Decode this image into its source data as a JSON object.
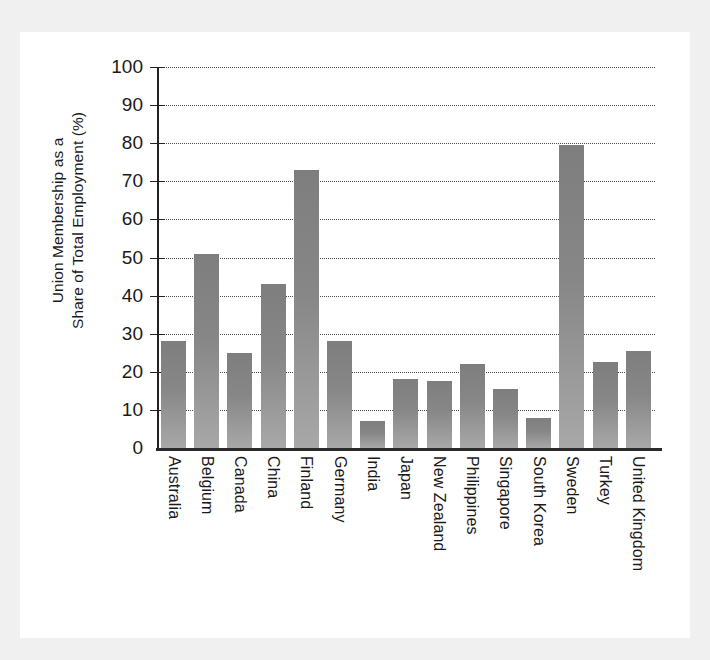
{
  "chart_data": {
    "type": "bar",
    "title": "",
    "xlabel": "",
    "ylabel": "Union Membership as a Share of Total Employment (%)",
    "ylabel_line1": "Union Membership as a",
    "ylabel_line2": "Share of Total Employment (%)",
    "ylim": [
      0,
      100
    ],
    "ytick_step": 10,
    "yticks": [
      100,
      90,
      80,
      70,
      60,
      50,
      40,
      30,
      20,
      10,
      0
    ],
    "grid": true,
    "grid_style": "dotted-horizontal",
    "legend": "none",
    "bar_color": "#8a8a8a",
    "bar_color_top": "#7e7e7e",
    "bar_color_bottom": "#a8a8a8",
    "axis_color": "#222222",
    "background": "#ffffff",
    "figure_background": "#f0f0f0",
    "categories": [
      "Australia",
      "Belgium",
      "Canada",
      "China",
      "Finland",
      "Germany",
      "India",
      "Japan",
      "New Zealand",
      "Philippines",
      "Singapore",
      "South Korea",
      "Sweden",
      "Turkey",
      "United Kingdom"
    ],
    "values": [
      28,
      51,
      25,
      43,
      73,
      28,
      7,
      18,
      17.5,
      22,
      15.5,
      8,
      79.5,
      22.5,
      25.5
    ]
  }
}
